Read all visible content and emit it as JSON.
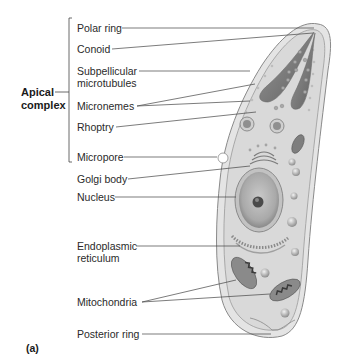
{
  "figure": {
    "caption": "(a)",
    "group_label": {
      "line1": "Apical",
      "line2": "complex"
    },
    "labels": [
      {
        "id": "polar-ring",
        "text": "Polar ring"
      },
      {
        "id": "conoid",
        "text": "Conoid"
      },
      {
        "id": "subpellicular-microtubules",
        "line1": "Subpellicular",
        "line2": "microtubules"
      },
      {
        "id": "micronemes",
        "text": "Micronemes"
      },
      {
        "id": "rhoptry",
        "text": "Rhoptry"
      },
      {
        "id": "micropore",
        "text": "Micropore"
      },
      {
        "id": "golgi-body",
        "text": "Golgi body"
      },
      {
        "id": "nucleus",
        "text": "Nucleus"
      },
      {
        "id": "endoplasmic-reticulum",
        "line1": "Endoplasmic",
        "line2": "reticulum"
      },
      {
        "id": "mitochondria",
        "text": "Mitochondria"
      },
      {
        "id": "posterior-ring",
        "text": "Posterior ring"
      }
    ],
    "colors": {
      "cell_fill": "#dcdcdc",
      "pellicle": "#c8c8c8",
      "outline": "#8a8a8a",
      "nucleus": "#b5b5b5",
      "leader_line": "#444444"
    }
  }
}
